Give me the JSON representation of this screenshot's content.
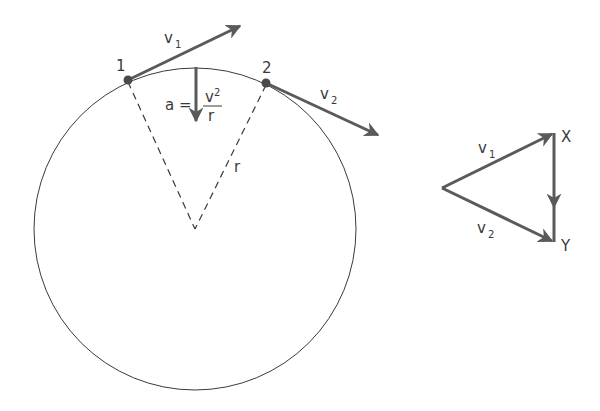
{
  "diagram": {
    "circle": {
      "points": [
        {
          "id": "point-1",
          "label": "1"
        },
        {
          "id": "point-2",
          "label": "2"
        }
      ],
      "radius_label": "r",
      "velocity_1": {
        "symbol": "v",
        "subscript": "1"
      },
      "velocity_2": {
        "symbol": "v",
        "subscript": "2"
      },
      "acceleration": {
        "lhs": "a =",
        "numerator": "v",
        "numerator_exp": "2",
        "denominator": "r"
      }
    },
    "vector_triangle": {
      "velocity_1": {
        "symbol": "v",
        "subscript": "1"
      },
      "velocity_2": {
        "symbol": "v",
        "subscript": "2"
      },
      "vertex_x": "X",
      "vertex_y": "Y"
    },
    "colors": {
      "vector": "#5a5a5a",
      "line": "#3a3a3a",
      "point": "#4a4a4a"
    }
  }
}
